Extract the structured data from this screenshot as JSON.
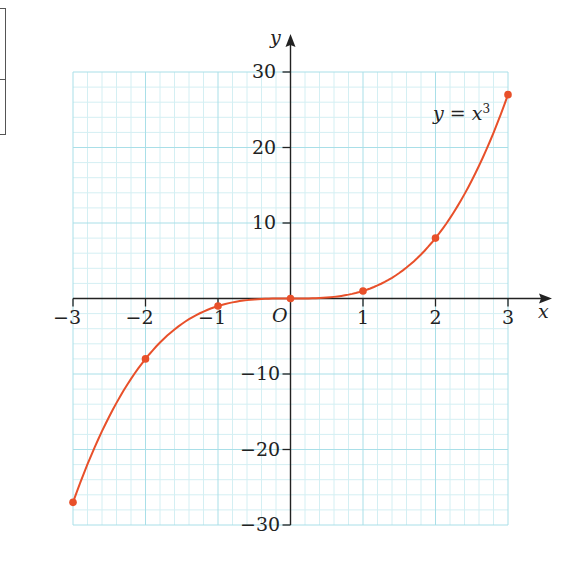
{
  "chart_data": {
    "type": "line",
    "title": "",
    "function_label": "y = x",
    "function_exponent": "3",
    "xlabel": "x",
    "ylabel": "y",
    "origin_label": "O",
    "xlim": [
      -3,
      3
    ],
    "ylim": [
      -30,
      30
    ],
    "x_ticks": [
      -3,
      -2,
      -1,
      1,
      2,
      3
    ],
    "x_tick_labels": [
      "−3",
      "−2",
      "−1",
      "1",
      "2",
      "3"
    ],
    "y_ticks": [
      -30,
      -20,
      -10,
      10,
      20,
      30
    ],
    "y_tick_labels": [
      "−30",
      "−20",
      "−10",
      "10",
      "20",
      "30"
    ],
    "grid": true,
    "points": {
      "x": [
        -3,
        -2,
        -1,
        0,
        1,
        2,
        3
      ],
      "y": [
        -27,
        -8,
        -1,
        0,
        1,
        8,
        27
      ]
    },
    "series": [
      {
        "name": "y = x^3",
        "color": "#e8502a"
      }
    ],
    "colors": {
      "curve": "#e8502a",
      "grid_major": "#a9dfe8",
      "grid_minor": "#d4eff3",
      "axis": "#222222"
    }
  }
}
